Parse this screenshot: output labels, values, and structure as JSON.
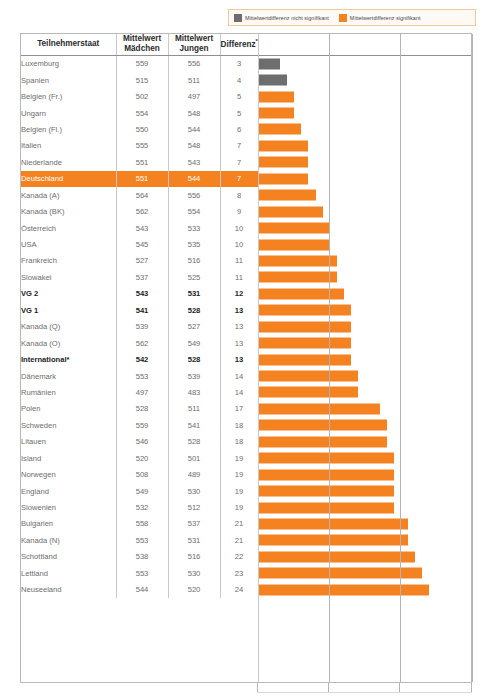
{
  "legend": {
    "items": [
      {
        "label": "Mittelwertdifferenz nicht signifikant",
        "color": "#6e6e6e",
        "swatch": "gray-swatch-icon"
      },
      {
        "label": "Mittelwertdifferenz signifikant",
        "color": "#f58220",
        "swatch": "orange-swatch-icon"
      }
    ]
  },
  "table": {
    "headers": {
      "state": "Teilnehmerstaat",
      "girls_line1": "Mittelwert",
      "girls_line2": "Mädchen",
      "boys_line1": "Mittelwert",
      "boys_line2": "Jungen",
      "diff": "Differenz",
      "diff_superscript": "**",
      "chart": ""
    }
  },
  "chart_data": {
    "type": "bar",
    "orientation": "horizontal",
    "title": "",
    "xlabel": "",
    "ylabel": "",
    "xlim": [
      0,
      30
    ],
    "grid": true,
    "gridlines_at": [
      0,
      10,
      20,
      30
    ],
    "legend_position": "top-right",
    "colors": {
      "significant": "#f58220",
      "not_significant": "#6e6e6e",
      "highlight_row": "#f58220"
    },
    "columns": [
      "Teilnehmerstaat",
      "Mittelwert Mädchen",
      "Mittelwert Jungen",
      "Differenz"
    ],
    "categories": [
      "Luxemburg",
      "Spanien",
      "Belgien (Fr.)",
      "Ungarn",
      "Belgien (Fl.)",
      "Italien",
      "Niederlande",
      "Deutschland",
      "Kanada (A)",
      "Kanada (BK)",
      "Österreich",
      "USA",
      "Frankreich",
      "Slowakei",
      "VG 2",
      "VG 1",
      "Kanada (Q)",
      "Kanada (O)",
      "International*",
      "Dänemark",
      "Rumänien",
      "Polen",
      "Schweden",
      "Litauen",
      "Island",
      "Norwegen",
      "England",
      "Slowenien",
      "Bulgarien",
      "Kanada (N)",
      "Schottland",
      "Lettland",
      "Neuseeland"
    ],
    "series": [
      {
        "name": "Mittelwert Mädchen",
        "values": [
          559,
          515,
          502,
          554,
          550,
          555,
          551,
          551,
          564,
          562,
          543,
          545,
          527,
          537,
          543,
          541,
          539,
          562,
          542,
          553,
          497,
          528,
          559,
          546,
          520,
          508,
          549,
          532,
          558,
          553,
          538,
          553,
          544
        ]
      },
      {
        "name": "Mittelwert Jungen",
        "values": [
          556,
          511,
          497,
          548,
          544,
          548,
          543,
          544,
          556,
          554,
          533,
          535,
          516,
          525,
          531,
          528,
          527,
          549,
          528,
          539,
          483,
          511,
          541,
          528,
          501,
          489,
          530,
          512,
          537,
          531,
          516,
          530,
          520
        ]
      },
      {
        "name": "Differenz",
        "values": [
          3,
          4,
          5,
          5,
          6,
          7,
          7,
          7,
          8,
          9,
          10,
          10,
          11,
          11,
          12,
          13,
          13,
          13,
          13,
          14,
          14,
          17,
          18,
          18,
          19,
          19,
          19,
          19,
          21,
          21,
          22,
          23,
          24
        ]
      }
    ],
    "rows": [
      {
        "state": "Luxemburg",
        "girls": "559",
        "boys": "556",
        "diff": "3",
        "value": 3,
        "sig": false,
        "bold": false,
        "highlight": false
      },
      {
        "state": "Spanien",
        "girls": "515",
        "boys": "511",
        "diff": "4",
        "value": 4,
        "sig": false,
        "bold": false,
        "highlight": false
      },
      {
        "state": "Belgien (Fr.)",
        "girls": "502",
        "boys": "497",
        "diff": "5",
        "value": 5,
        "sig": true,
        "bold": false,
        "highlight": false
      },
      {
        "state": "Ungarn",
        "girls": "554",
        "boys": "548",
        "diff": "5",
        "value": 5,
        "sig": true,
        "bold": false,
        "highlight": false
      },
      {
        "state": "Belgien (Fl.)",
        "girls": "550",
        "boys": "544",
        "diff": "6",
        "value": 6,
        "sig": true,
        "bold": false,
        "highlight": false
      },
      {
        "state": "Italien",
        "girls": "555",
        "boys": "548",
        "diff": "7",
        "value": 7,
        "sig": true,
        "bold": false,
        "highlight": false
      },
      {
        "state": "Niederlande",
        "girls": "551",
        "boys": "543",
        "diff": "7",
        "value": 7,
        "sig": true,
        "bold": false,
        "highlight": false
      },
      {
        "state": "Deutschland",
        "girls": "551",
        "boys": "544",
        "diff": "7",
        "value": 7,
        "sig": true,
        "bold": false,
        "highlight": true
      },
      {
        "state": "Kanada (A)",
        "girls": "564",
        "boys": "556",
        "diff": "8",
        "value": 8,
        "sig": true,
        "bold": false,
        "highlight": false
      },
      {
        "state": "Kanada (BK)",
        "girls": "562",
        "boys": "554",
        "diff": "9",
        "value": 9,
        "sig": true,
        "bold": false,
        "highlight": false
      },
      {
        "state": "Österreich",
        "girls": "543",
        "boys": "533",
        "diff": "10",
        "value": 10,
        "sig": true,
        "bold": false,
        "highlight": false
      },
      {
        "state": "USA",
        "girls": "545",
        "boys": "535",
        "diff": "10",
        "value": 10,
        "sig": true,
        "bold": false,
        "highlight": false
      },
      {
        "state": "Frankreich",
        "girls": "527",
        "boys": "516",
        "diff": "11",
        "value": 11,
        "sig": true,
        "bold": false,
        "highlight": false
      },
      {
        "state": "Slowakei",
        "girls": "537",
        "boys": "525",
        "diff": "11",
        "value": 11,
        "sig": true,
        "bold": false,
        "highlight": false
      },
      {
        "state": "VG 2",
        "girls": "543",
        "boys": "531",
        "diff": "12",
        "value": 12,
        "sig": true,
        "bold": true,
        "highlight": false
      },
      {
        "state": "VG 1",
        "girls": "541",
        "boys": "528",
        "diff": "13",
        "value": 13,
        "sig": true,
        "bold": true,
        "highlight": false
      },
      {
        "state": "Kanada (Q)",
        "girls": "539",
        "boys": "527",
        "diff": "13",
        "value": 13,
        "sig": true,
        "bold": false,
        "highlight": false
      },
      {
        "state": "Kanada (O)",
        "girls": "562",
        "boys": "549",
        "diff": "13",
        "value": 13,
        "sig": true,
        "bold": false,
        "highlight": false
      },
      {
        "state": "International*",
        "girls": "542",
        "boys": "528",
        "diff": "13",
        "value": 13,
        "sig": true,
        "bold": true,
        "highlight": false
      },
      {
        "state": "Dänemark",
        "girls": "553",
        "boys": "539",
        "diff": "14",
        "value": 14,
        "sig": true,
        "bold": false,
        "highlight": false
      },
      {
        "state": "Rumänien",
        "girls": "497",
        "boys": "483",
        "diff": "14",
        "value": 14,
        "sig": true,
        "bold": false,
        "highlight": false
      },
      {
        "state": "Polen",
        "girls": "528",
        "boys": "511",
        "diff": "17",
        "value": 17,
        "sig": true,
        "bold": false,
        "highlight": false
      },
      {
        "state": "Schweden",
        "girls": "559",
        "boys": "541",
        "diff": "18",
        "value": 18,
        "sig": true,
        "bold": false,
        "highlight": false
      },
      {
        "state": "Litauen",
        "girls": "546",
        "boys": "528",
        "diff": "18",
        "value": 18,
        "sig": true,
        "bold": false,
        "highlight": false
      },
      {
        "state": "Island",
        "girls": "520",
        "boys": "501",
        "diff": "19",
        "value": 19,
        "sig": true,
        "bold": false,
        "highlight": false
      },
      {
        "state": "Norwegen",
        "girls": "508",
        "boys": "489",
        "diff": "19",
        "value": 19,
        "sig": true,
        "bold": false,
        "highlight": false
      },
      {
        "state": "England",
        "girls": "549",
        "boys": "530",
        "diff": "19",
        "value": 19,
        "sig": true,
        "bold": false,
        "highlight": false
      },
      {
        "state": "Slowenien",
        "girls": "532",
        "boys": "512",
        "diff": "19",
        "value": 19,
        "sig": true,
        "bold": false,
        "highlight": false
      },
      {
        "state": "Bulgarien",
        "girls": "558",
        "boys": "537",
        "diff": "21",
        "value": 21,
        "sig": true,
        "bold": false,
        "highlight": false
      },
      {
        "state": "Kanada (N)",
        "girls": "553",
        "boys": "531",
        "diff": "21",
        "value": 21,
        "sig": true,
        "bold": false,
        "highlight": false
      },
      {
        "state": "Schottland",
        "girls": "538",
        "boys": "516",
        "diff": "22",
        "value": 22,
        "sig": true,
        "bold": false,
        "highlight": false
      },
      {
        "state": "Lettland",
        "girls": "553",
        "boys": "530",
        "diff": "23",
        "value": 23,
        "sig": true,
        "bold": false,
        "highlight": false
      },
      {
        "state": "Neuseeland",
        "girls": "544",
        "boys": "520",
        "diff": "24",
        "value": 24,
        "sig": true,
        "bold": false,
        "highlight": false
      }
    ]
  }
}
